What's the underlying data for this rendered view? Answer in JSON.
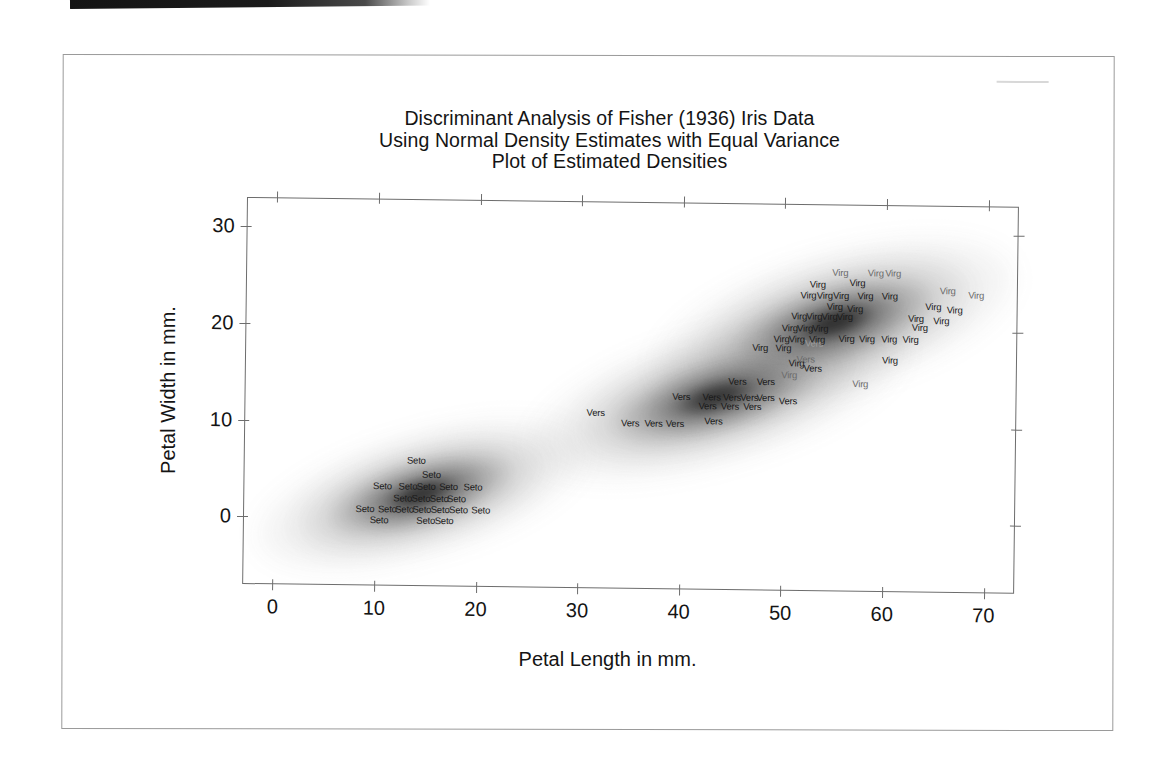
{
  "document": {
    "type": "scanned-page",
    "scan_artifact_bar": true
  },
  "chart_data": {
    "type": "scatter",
    "title": "Discriminant Analysis of Fisher (1936) Iris Data",
    "subtitle": "Using Normal Density Estimates with Equal Variance",
    "subtitle2": "Plot of Estimated Densities",
    "xlabel": "Petal Length in mm.",
    "ylabel": "Petal Width in mm.",
    "xlim": [
      -3,
      73
    ],
    "ylim": [
      -7,
      33
    ],
    "xticks": [
      0,
      10,
      20,
      30,
      40,
      50,
      60,
      70
    ],
    "yticks": [
      0,
      10,
      20,
      30
    ],
    "xtick_labels": [
      "0",
      "10",
      "20",
      "30",
      "40",
      "50",
      "60",
      "70"
    ],
    "ytick_labels": [
      "0",
      "10",
      "20",
      "30"
    ],
    "grid": false,
    "legend": "none",
    "ticks_all_sides": true,
    "series": [
      {
        "name": "Setosa",
        "point_label": "Seto",
        "density_center": [
          14.5,
          2.5
        ],
        "points": [
          [
            14.0,
            6.0
          ],
          [
            15.5,
            4.6
          ],
          [
            10.7,
            3.3
          ],
          [
            13.2,
            3.3
          ],
          [
            15.0,
            3.3
          ],
          [
            17.2,
            3.3
          ],
          [
            19.6,
            3.3
          ],
          [
            12.7,
            2.1
          ],
          [
            14.5,
            2.1
          ],
          [
            16.3,
            2.1
          ],
          [
            18.0,
            2.1
          ],
          [
            9.0,
            1.0
          ],
          [
            11.2,
            1.0
          ],
          [
            12.9,
            1.0
          ],
          [
            14.6,
            1.0
          ],
          [
            16.4,
            1.0
          ],
          [
            18.2,
            1.0
          ],
          [
            20.4,
            1.0
          ],
          [
            10.4,
            -0.2
          ],
          [
            15.0,
            -0.2
          ],
          [
            16.8,
            -0.2
          ]
        ]
      },
      {
        "name": "Versicolor",
        "point_label": "Vers",
        "density_center": [
          43.5,
          13.5
        ],
        "points": [
          [
            45.5,
            14.6
          ],
          [
            48.3,
            14.6
          ],
          [
            40.0,
            13.0
          ],
          [
            43.0,
            13.0
          ],
          [
            45.0,
            13.0
          ],
          [
            46.7,
            13.0
          ],
          [
            48.3,
            13.0
          ],
          [
            42.6,
            12.0
          ],
          [
            44.8,
            12.0
          ],
          [
            47.0,
            12.0
          ],
          [
            50.5,
            12.6
          ],
          [
            31.6,
            11.2
          ],
          [
            35.0,
            10.2
          ],
          [
            37.3,
            10.2
          ],
          [
            39.4,
            10.2
          ],
          [
            43.2,
            10.5
          ],
          [
            52.2,
            17.0
          ],
          [
            52.9,
            16.0
          ],
          [
            53.0,
            18.6
          ]
        ]
      },
      {
        "name": "Virginica",
        "point_label": "Virg",
        "density_center": [
          55.0,
          20.5
        ],
        "points": [
          [
            55.5,
            26.0
          ],
          [
            59.0,
            26.0
          ],
          [
            60.7,
            26.0
          ],
          [
            53.3,
            24.7
          ],
          [
            57.2,
            24.9
          ],
          [
            52.4,
            23.6
          ],
          [
            54.0,
            23.6
          ],
          [
            55.6,
            23.6
          ],
          [
            58.0,
            23.6
          ],
          [
            60.4,
            23.6
          ],
          [
            66.1,
            24.2
          ],
          [
            68.9,
            23.8
          ],
          [
            55.0,
            22.5
          ],
          [
            57.0,
            22.3
          ],
          [
            64.7,
            22.6
          ],
          [
            66.8,
            22.2
          ],
          [
            51.5,
            21.4
          ],
          [
            53.0,
            21.4
          ],
          [
            54.5,
            21.4
          ],
          [
            56.0,
            21.4
          ],
          [
            63.0,
            21.3
          ],
          [
            65.5,
            21.1
          ],
          [
            50.6,
            20.2
          ],
          [
            52.1,
            20.2
          ],
          [
            53.6,
            20.2
          ],
          [
            63.4,
            20.4
          ],
          [
            49.8,
            19.0
          ],
          [
            51.3,
            19.0
          ],
          [
            53.3,
            19.0
          ],
          [
            56.2,
            19.2
          ],
          [
            58.2,
            19.2
          ],
          [
            60.4,
            19.2
          ],
          [
            62.5,
            19.1
          ],
          [
            47.7,
            18.1
          ],
          [
            50.0,
            18.1
          ],
          [
            51.3,
            16.6
          ],
          [
            60.5,
            17.0
          ],
          [
            50.6,
            15.3
          ],
          [
            57.6,
            14.5
          ]
        ]
      }
    ]
  }
}
